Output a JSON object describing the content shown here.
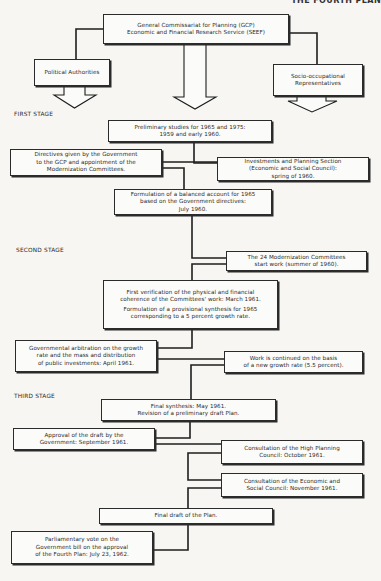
{
  "page_header": {
    "text": "THE FOURTH PLAN"
  },
  "stages": {
    "first": "FIRST STAGE",
    "second": "SECOND STAGE",
    "third": "THIRD STAGE"
  },
  "top": {
    "gcp": [
      "General Commissariat for Planning (GCP)",
      "Economic and Financial Research Service (SEEF)"
    ],
    "political": [
      "Political Authorities"
    ],
    "socio": [
      "Socio-occupational",
      "Representatives"
    ]
  },
  "first_stage": {
    "preliminary": [
      "Preliminary studies for 1965 and 1975:",
      "1959 and early 1960."
    ],
    "directives": [
      "Directives given by the Government",
      "to the GCP and appointment of the",
      "Modernization Committees."
    ],
    "investments": [
      "Investments and Planning Section",
      "(Economic and Social Council):",
      "spring of 1960."
    ],
    "formulation": [
      "Formulation of a balanced account for 1965",
      "based on the Government directives:",
      "July 1960."
    ]
  },
  "second_stage": {
    "committees": [
      "The 24 Modernization Committees",
      "start work (summer of 1960)."
    ],
    "verification": [
      "First verification of the physical and financial",
      "coherence of the Committees' work: March 1961."
    ],
    "provisional": [
      "Formulation of a provisional synthesis for 1965",
      "corresponding to a 5 percent growth rate."
    ],
    "arbitration": [
      "Governmental arbitration on the growth",
      "rate and the mass and distribution",
      "of public investments: April 1961."
    ],
    "continued": [
      "Work is continued on the basis",
      "of a new growth rate (5.5 percent)."
    ]
  },
  "third_stage": {
    "final_synthesis": [
      "Final synthesis: May 1961.",
      "Revision of a preliminary draft Plan."
    ],
    "approval": [
      "Approval of the draft by the",
      "Government: September 1961."
    ],
    "high_planning": [
      "Consultation of the High Planning",
      "Council: October 1961."
    ],
    "esc": [
      "Consultation of the Economic and",
      "Social Council: November 1961."
    ],
    "final_draft": [
      "Final draft of the Plan."
    ],
    "parliamentary": [
      "Parliamentary vote on the",
      "Government bill on the approval",
      "of the Fourth Plan: July 23, 1962."
    ]
  },
  "colors": {
    "line": "#1e1e1e",
    "box_bg": "#fbfbf9",
    "page_bg": "#f7f6f3"
  }
}
